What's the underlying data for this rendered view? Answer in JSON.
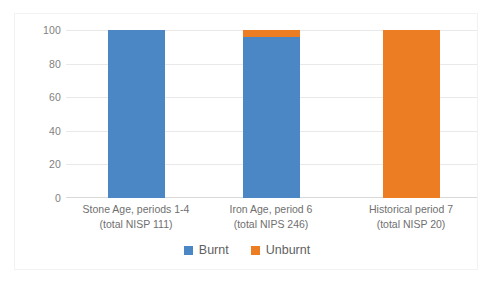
{
  "chart_data": {
    "type": "bar",
    "subtype": "100% stacked column",
    "title": "",
    "xlabel": "",
    "ylabel": "",
    "ylim": [
      0,
      100
    ],
    "yticks": [
      0,
      20,
      40,
      60,
      80,
      100
    ],
    "ytick_labels": [
      "0",
      "20",
      "40",
      "60",
      "80",
      "100"
    ],
    "grid": true,
    "legend_position": "bottom-center",
    "categories": [
      "Stone Age, periods 1-4\n(total NISP 111)",
      "Iron Age, period 6\n(total NIPS 246)",
      "Historical period 7\n(total NISP 20)"
    ],
    "category_lines": [
      {
        "line1": "Stone Age, periods 1-4",
        "line2": "(total NISP 111)"
      },
      {
        "line1": "Iron Age, period 6",
        "line2": "(total NIPS 246)"
      },
      {
        "line1": "Historical period 7",
        "line2": "(total NISP 20)"
      }
    ],
    "series": [
      {
        "name": "Burnt",
        "color": "#4a87c4",
        "values": [
          100,
          96,
          0
        ]
      },
      {
        "name": "Unburnt",
        "color": "#ed7d23",
        "values": [
          0,
          4,
          100
        ]
      }
    ]
  },
  "legend": {
    "items": [
      {
        "label": "Burnt",
        "color": "#4a87c4"
      },
      {
        "label": "Unburnt",
        "color": "#ed7d23"
      }
    ]
  },
  "axis": {
    "y_labels": [
      "100",
      "80",
      "60",
      "40",
      "20",
      "0"
    ]
  }
}
